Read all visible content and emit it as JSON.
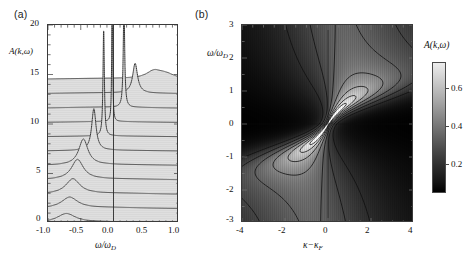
{
  "figure": {
    "panels": [
      {
        "tag": "(a)",
        "type": "waterfall-line",
        "xlabel_main": "ω/ω",
        "xlabel_sub": "D",
        "ylabel": "A(k,ω)"
      },
      {
        "tag": "(b)",
        "type": "density-contour",
        "xlabel_main": "κ−κ",
        "xlabel_sub": "F",
        "ylabel_main": "ω/ω",
        "ylabel_sub": "D"
      }
    ],
    "colorbar": {
      "label": "A(k,ω)",
      "ticks": [
        "0.6",
        "0.4",
        "0.2"
      ],
      "tick_values": [
        0.6,
        0.4,
        0.2
      ],
      "vmin": 0.0,
      "vmax": 0.72,
      "low_color": "#000000",
      "high_color": "#ededed"
    }
  },
  "chart_data": [
    {
      "type": "line",
      "panel": "(a)",
      "title": "",
      "xlabel": "ω/ω_D",
      "ylabel": "A(k,ω)",
      "xlim": [
        -1.0,
        1.0
      ],
      "ylim": [
        0,
        20
      ],
      "xticks": [
        -1.0,
        -0.5,
        0.0,
        0.5,
        1.0
      ],
      "xticklabels": [
        "-1.0",
        "-0.5",
        "0.0",
        "0.5",
        "1.0"
      ],
      "yticks": [
        0,
        5,
        10,
        15,
        20
      ],
      "yticklabels": [
        "0",
        "5",
        "10",
        "15",
        "20"
      ],
      "grid": false,
      "legend": false,
      "description": "Stacked (waterfall) spectral functions A(k,omega) for a sequence of momenta k. Each curve is offset vertically; filled light-grey beneath. Broad peaks at negative omega for small k evolve into sharp quasiparticle peaks near omega=0 and move to positive omega at large k.",
      "series": [
        {
          "name": "k1",
          "offset": 0.0,
          "peak_x": -0.72,
          "peak_height": 0.9,
          "peak_width": 0.17,
          "sharp": false
        },
        {
          "name": "k2",
          "offset": 1.45,
          "peak_x": -0.67,
          "peak_height": 1.1,
          "peak_width": 0.15,
          "sharp": false
        },
        {
          "name": "k3",
          "offset": 2.9,
          "peak_x": -0.62,
          "peak_height": 1.5,
          "peak_width": 0.13,
          "sharp": false
        },
        {
          "name": "k4",
          "offset": 4.35,
          "peak_x": -0.55,
          "peak_height": 2.0,
          "peak_width": 0.11,
          "sharp": false
        },
        {
          "name": "k5",
          "offset": 5.8,
          "peak_x": -0.46,
          "peak_height": 2.6,
          "peak_width": 0.085,
          "sharp": false
        },
        {
          "name": "k6",
          "offset": 7.25,
          "peak_x": -0.3,
          "peak_height": 4.2,
          "peak_width": 0.04,
          "sharp": true
        },
        {
          "name": "k7",
          "offset": 8.7,
          "peak_x": -0.15,
          "peak_height": 11.0,
          "peak_width": 0.012,
          "sharp": true
        },
        {
          "name": "k8",
          "offset": 10.15,
          "peak_x": -0.02,
          "peak_height": 16.0,
          "peak_width": 0.007,
          "sharp": true
        },
        {
          "name": "k9",
          "offset": 11.6,
          "peak_x": 0.16,
          "peak_height": 10.5,
          "peak_width": 0.013,
          "sharp": true
        },
        {
          "name": "k10",
          "offset": 13.05,
          "peak_x": 0.33,
          "peak_height": 3.0,
          "peak_width": 0.045,
          "sharp": true
        },
        {
          "name": "k11",
          "offset": 14.5,
          "peak_x": 0.62,
          "peak_height": 0.75,
          "peak_width": 0.14,
          "sharp": false
        },
        {
          "name": "k12",
          "offset": 14.5,
          "peak_x": 0.8,
          "peak_height": 0.45,
          "peak_width": 0.16,
          "sharp": false
        }
      ],
      "vertical_reference_line": 0.0
    },
    {
      "type": "heatmap",
      "panel": "(b)",
      "title": "",
      "xlabel": "κ−κ_F",
      "ylabel": "ω/ω_D",
      "xlim": [
        -4,
        4
      ],
      "ylim": [
        -3,
        3
      ],
      "xticks": [
        -4,
        -2,
        0,
        2,
        4
      ],
      "xticklabels": [
        "-4",
        "-2",
        "0",
        "2",
        "4"
      ],
      "yticks": [
        -3,
        -2,
        -1,
        0,
        1,
        2,
        3
      ],
      "yticklabels": [
        "-3",
        "-2",
        "-1",
        "0",
        "1",
        "2",
        "3"
      ],
      "grid": false,
      "legend": false,
      "colorbar_label": "A(k,ω)",
      "colorbar_ticks": [
        0.2,
        0.4,
        0.6
      ],
      "cmap": "grayscale-dark-to-light",
      "description": "Density plot of the spectral function A(k,omega) in the (kappa-kappa_F, omega/omega_D) plane with superposed contour lines. Intensity concentrates along a steep diagonal dispersion branch through the origin; two bright closed-contour lobes sit near (-1.3,-0.6) and (+1.3,+0.6); kinks in the dispersion appear near omega/omega_D = +-1.",
      "bright_lobes": [
        {
          "cx": -1.3,
          "cy": -0.65,
          "peak": 0.72
        },
        {
          "cx": 1.3,
          "cy": 0.65,
          "peak": 0.72
        }
      ],
      "contour_levels": [
        0.08,
        0.14,
        0.22,
        0.32,
        0.44,
        0.56,
        0.66
      ]
    }
  ]
}
